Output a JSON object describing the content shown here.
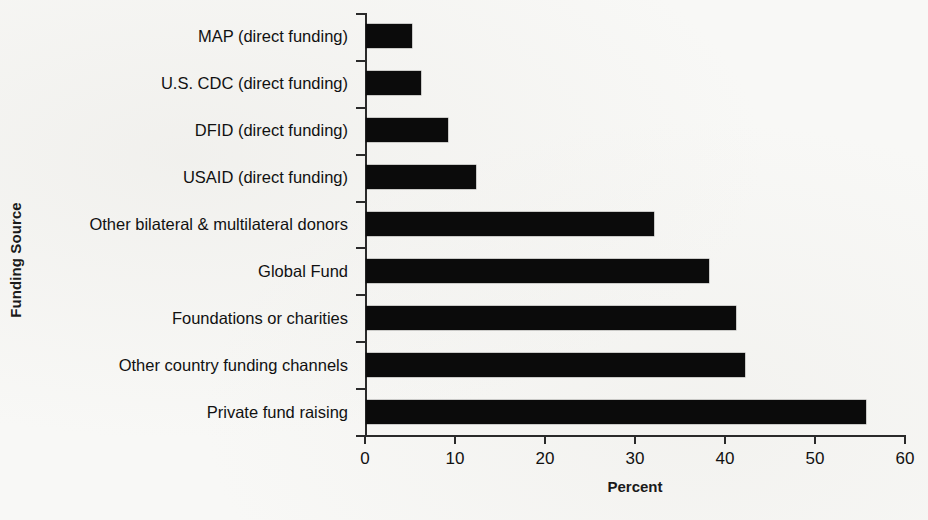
{
  "chart_data": {
    "type": "bar",
    "orientation": "horizontal",
    "title": "",
    "xlabel": "Percent",
    "ylabel": "Funding Source",
    "xlim": [
      0,
      60
    ],
    "xticks": [
      0,
      10,
      20,
      30,
      40,
      50,
      60
    ],
    "xtick_labels": [
      "0",
      "10",
      "20",
      "30",
      "40",
      "50",
      "60"
    ],
    "grid": false,
    "legend": false,
    "bar_color": "#0b0b0b",
    "background_color": "#f8f8f6",
    "categories": [
      "MAP (direct funding)",
      "U.S. CDC (direct funding)",
      "DFID (direct funding)",
      "USAID (direct funding)",
      "Other bilateral & multilateral donors",
      "Global Fund",
      "Foundations or charities",
      "Other country funding channels",
      "Private fund raising"
    ],
    "values": [
      5.1,
      6.1,
      9.1,
      12.2,
      32.0,
      38.1,
      41.1,
      42.1,
      55.5
    ]
  }
}
